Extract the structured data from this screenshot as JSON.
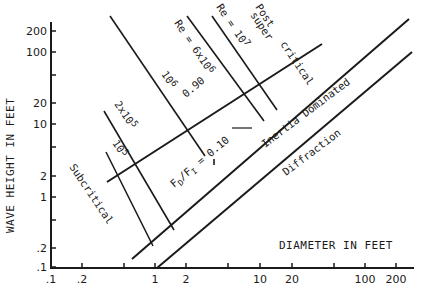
{
  "chart_data": {
    "type": "line",
    "title": "",
    "xlabel": "DIAMETER IN FEET",
    "ylabel": "WAVE HEIGHT IN FEET",
    "xscale": "log",
    "yscale": "log",
    "xlim": [
      0.1,
      300
    ],
    "ylim": [
      0.1,
      300
    ],
    "grid": false,
    "x_ticks": [
      0.1,
      0.2,
      0.5,
      1,
      2,
      5,
      10,
      20,
      50,
      100,
      200
    ],
    "x_tick_labels": [
      ".1",
      ".2",
      "",
      "1",
      "2",
      "",
      "10",
      "20",
      "",
      "100",
      "200"
    ],
    "y_ticks": [
      0.1,
      0.2,
      0.5,
      1,
      2,
      5,
      10,
      20,
      50,
      100,
      200
    ],
    "y_tick_labels": [
      ".1",
      ".2",
      "",
      "1",
      "2",
      "",
      "10",
      "20",
      "",
      "100",
      "200"
    ],
    "series": [
      {
        "name": "Subcritical / Post-supercritical boundary (H/D = 0.90 line)",
        "x": [
          0.4,
          25
        ],
        "y": [
          1.5,
          180
        ]
      },
      {
        "name": "F_D/F_I = 0.10 (Inertia dominated boundary)",
        "x": [
          0.85,
          250
        ],
        "y": [
          0.15,
          230
        ]
      },
      {
        "name": "Diffraction boundary",
        "x": [
          1.6,
          250
        ],
        "y": [
          0.1,
          75
        ]
      },
      {
        "name": "Re = 10^5",
        "x": [
          0.4,
          1.0
        ],
        "y": [
          6.5,
          0.3
        ]
      },
      {
        "name": "Re = 2x10^5",
        "x": [
          0.4,
          2.0
        ],
        "y": [
          19,
          0.55
        ]
      },
      {
        "name": "Re = 10^6",
        "x": [
          0.45,
          3.5
        ],
        "y": [
          350,
          3.0
        ]
      },
      {
        "name": "Re = 6x10^6",
        "x": [
          3.0,
          12
        ],
        "y": [
          350,
          12
        ]
      },
      {
        "name": "Re = 10^7",
        "x": [
          4.5,
          15
        ],
        "y": [
          350,
          17
        ]
      }
    ],
    "annotations": [
      {
        "text": "Subcritical",
        "region": "lower-left"
      },
      {
        "text": "Post supercritical",
        "region": "upper-middle"
      },
      {
        "text": "Inertia Dominated",
        "region": "middle-right band"
      },
      {
        "text": "Diffraction",
        "region": "lower-right"
      },
      {
        "text": "Re = 6x10^6",
        "on": "Re line"
      },
      {
        "text": "Re = 10^7",
        "on": "Re line"
      },
      {
        "text": "10^6",
        "on": "Re line"
      },
      {
        "text": "2x10^5",
        "on": "Re line"
      },
      {
        "text": "10^5",
        "on": "Re line"
      },
      {
        "text": "0.90",
        "on": "subcritical boundary"
      },
      {
        "text": "F_D/F_I = 0.10",
        "on": "inertia boundary"
      }
    ]
  },
  "labels": {
    "ylabel": "WAVE HEIGHT IN FEET",
    "xlabel": "DIAMETER IN FEET",
    "subcritical": "Subcritical",
    "post": "Post",
    "super": "super",
    "critical": "critical",
    "inertia": "Inertia Dominated",
    "diffraction": "Diffraction",
    "re_6e6_a": "Re = 6x10",
    "re_6e6_exp": "6",
    "re_1e7_a": "Re = 10",
    "re_1e7_exp": "7",
    "re_1e6": "10",
    "re_1e6_exp": "6",
    "re_2e5": "2x10",
    "re_2e5_exp": "5",
    "re_1e5": "10",
    "re_1e5_exp": "5",
    "ratio_090": "0.90",
    "fd": "F",
    "fd_sub": "D",
    "fi": "/F",
    "fi_sub": "I",
    "eq_010": " = 0.10"
  },
  "yticks": [
    {
      "label": "200",
      "y": 31
    },
    {
      "label": "100",
      "y": 52
    },
    {
      "label": "",
      "y": 75
    },
    {
      "label": "20",
      "y": 103
    },
    {
      "label": "10",
      "y": 124
    },
    {
      "label": "",
      "y": 147
    },
    {
      "label": "2",
      "y": 176
    },
    {
      "label": "1",
      "y": 197
    },
    {
      "label": "",
      "y": 220
    },
    {
      "label": ".2",
      "y": 248
    },
    {
      "label": ".1",
      "y": 267
    }
  ],
  "xticks": [
    {
      "label": ".1",
      "x": 51
    },
    {
      "label": ".2",
      "x": 82
    },
    {
      "label": "",
      "x": 124
    },
    {
      "label": "1",
      "x": 155
    },
    {
      "label": "2",
      "x": 186
    },
    {
      "label": "",
      "x": 228
    },
    {
      "label": "10",
      "x": 260
    },
    {
      "label": "20",
      "x": 292
    },
    {
      "label": "",
      "x": 334
    },
    {
      "label": "100",
      "x": 365
    },
    {
      "label": "200",
      "x": 396
    }
  ]
}
